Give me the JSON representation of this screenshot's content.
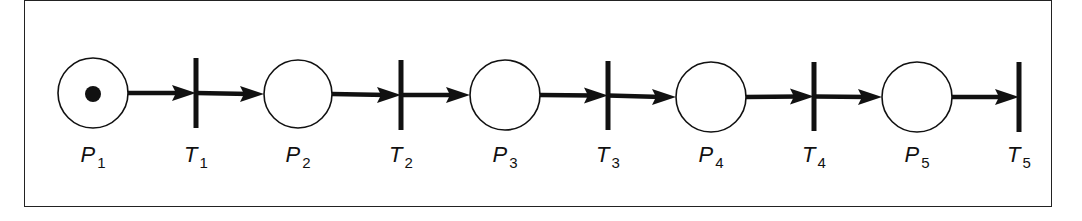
{
  "diagram": {
    "type": "petri-net",
    "colors": {
      "stroke": "#111111",
      "background": "#ffffff",
      "token": "#111111"
    },
    "places": [
      {
        "id": "P1",
        "letter": "P",
        "sub": "1",
        "cx": 93,
        "cy": 93,
        "r": 35,
        "tokens": 1
      },
      {
        "id": "P2",
        "letter": "P",
        "sub": "2",
        "cx": 298,
        "cy": 94,
        "r": 34,
        "tokens": 0
      },
      {
        "id": "P3",
        "letter": "P",
        "sub": "3",
        "cx": 505,
        "cy": 95,
        "r": 35,
        "tokens": 0
      },
      {
        "id": "P4",
        "letter": "P",
        "sub": "4",
        "cx": 711,
        "cy": 97,
        "r": 35,
        "tokens": 0
      },
      {
        "id": "P5",
        "letter": "P",
        "sub": "5",
        "cx": 917,
        "cy": 97,
        "r": 35,
        "tokens": 0
      }
    ],
    "transitions": [
      {
        "id": "T1",
        "letter": "T",
        "sub": "1",
        "x": 196,
        "y1": 58,
        "y2": 128
      },
      {
        "id": "T2",
        "letter": "T",
        "sub": "2",
        "x": 401,
        "y1": 60,
        "y2": 130
      },
      {
        "id": "T3",
        "letter": "T",
        "sub": "3",
        "x": 608,
        "y1": 61,
        "y2": 130
      },
      {
        "id": "T4",
        "letter": "T",
        "sub": "4",
        "x": 814,
        "y1": 62,
        "y2": 131
      },
      {
        "id": "T5",
        "letter": "T",
        "sub": "5",
        "x": 1019,
        "y1": 62,
        "y2": 132
      }
    ],
    "arcs": [
      [
        "P1",
        "T1"
      ],
      [
        "T1",
        "P2"
      ],
      [
        "P2",
        "T2"
      ],
      [
        "T2",
        "P3"
      ],
      [
        "P3",
        "T3"
      ],
      [
        "T3",
        "P4"
      ],
      [
        "P4",
        "T4"
      ],
      [
        "T4",
        "P5"
      ],
      [
        "P5",
        "T5"
      ]
    ],
    "label_top": 142
  }
}
